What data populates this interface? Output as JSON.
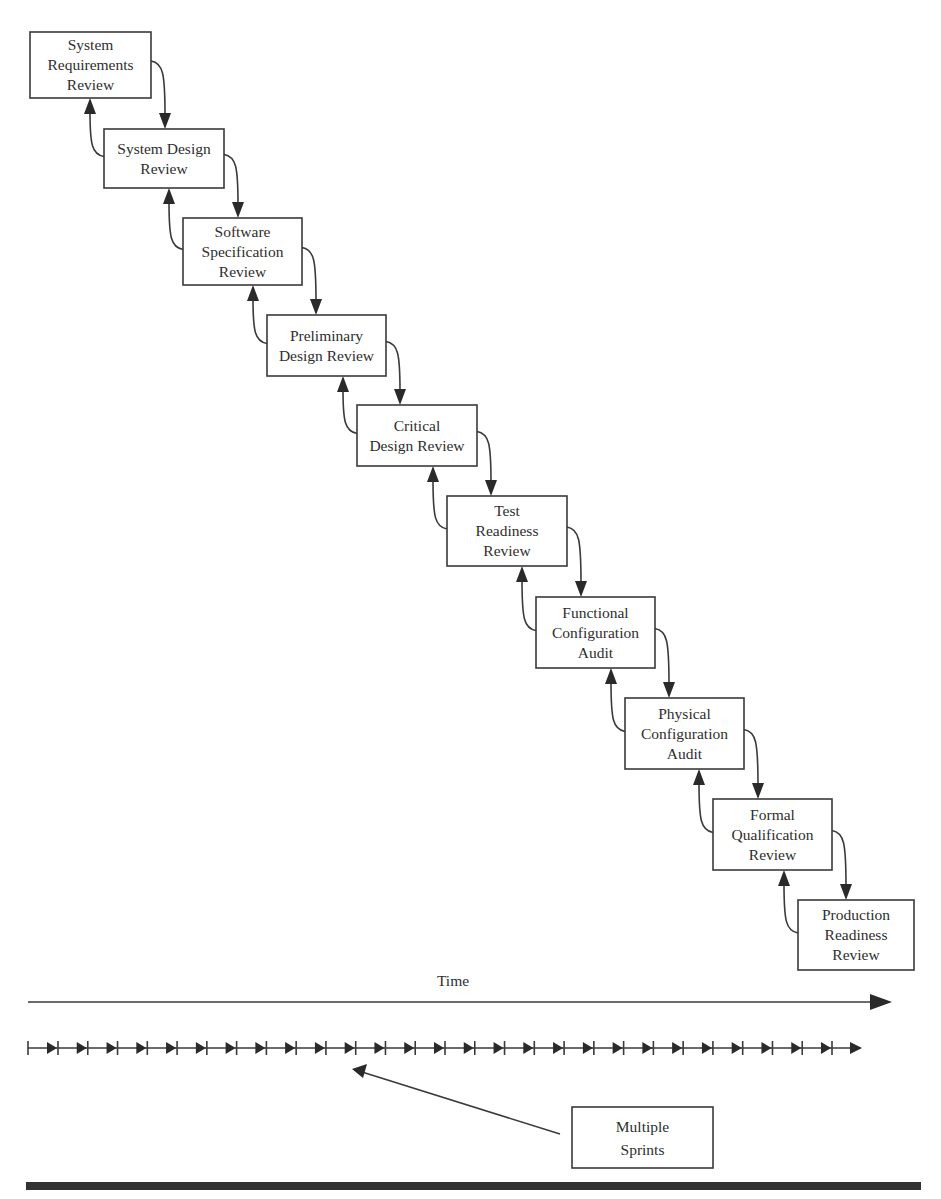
{
  "diagram": {
    "type": "waterfall-reviews",
    "stages": [
      {
        "id": "srr",
        "lines": [
          "System",
          "Requirements",
          "Review"
        ]
      },
      {
        "id": "sdr",
        "lines": [
          "System Design",
          "Review"
        ]
      },
      {
        "id": "ssr",
        "lines": [
          "Software",
          "Specification",
          "Review"
        ]
      },
      {
        "id": "pdr",
        "lines": [
          "Preliminary",
          "Design Review"
        ]
      },
      {
        "id": "cdr",
        "lines": [
          "Critical",
          "Design Review"
        ]
      },
      {
        "id": "trr",
        "lines": [
          "Test",
          "Readiness",
          "Review"
        ]
      },
      {
        "id": "fca",
        "lines": [
          "Functional",
          "Configuration",
          "Audit"
        ]
      },
      {
        "id": "pca",
        "lines": [
          "Physical",
          "Configuration",
          "Audit"
        ]
      },
      {
        "id": "fqr",
        "lines": [
          "Formal",
          "Qualification",
          "Review"
        ]
      },
      {
        "id": "prr",
        "lines": [
          "Production",
          "Readiness",
          "Review"
        ]
      }
    ],
    "connections": "each stage has a forward arrow to the next stage and a feedback arrow back to the previous stage",
    "time_axis": {
      "label": "Time"
    },
    "sprints": {
      "count": 27,
      "callout_lines": [
        "Multiple",
        "Sprints"
      ]
    }
  }
}
